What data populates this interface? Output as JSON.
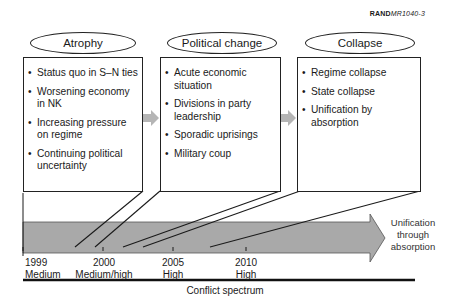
{
  "reference": {
    "bold": "RAND",
    "italic": "MR1040-3"
  },
  "stages": [
    {
      "title": "Atrophy",
      "items": [
        "Status quo in S–N ties",
        "Worsening economy in NK",
        "Increasing pressure on regime",
        "Continuing political uncertainty"
      ]
    },
    {
      "title": "Political change",
      "items": [
        "Acute economic situation",
        "Divisions in party leadership",
        "Sporadic uprisings",
        "Military coup"
      ]
    },
    {
      "title": "Collapse",
      "items": [
        "Regime collapse",
        "State collapse",
        "Unification by absorption"
      ]
    }
  ],
  "arrow_label": "Unification through absorption",
  "timeline": [
    {
      "year": "1999",
      "level": "Medium"
    },
    {
      "year": "2000",
      "level": "Medium/high"
    },
    {
      "year": "2005",
      "level": "High"
    },
    {
      "year": "2010",
      "level": "High"
    }
  ],
  "axis_label": "Conflict spectrum",
  "colors": {
    "arrow_fill": "#a9a9a9",
    "small_arrow": "#b0b0b0",
    "line": "#1a1a1a"
  }
}
